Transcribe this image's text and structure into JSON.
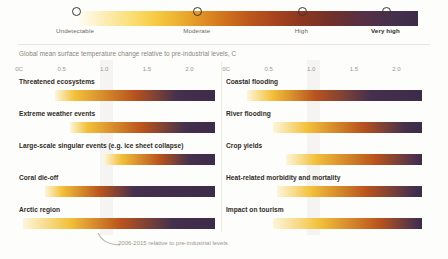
{
  "legend": {
    "title": "risk-legend",
    "stops": [
      {
        "label": "Undetectable",
        "pos": 0.0,
        "bold": false
      },
      {
        "label": "Moderate",
        "pos": 0.355,
        "bold": false
      },
      {
        "label": "High",
        "pos": 0.66,
        "bold": false
      },
      {
        "label": "Very high",
        "pos": 0.905,
        "bold": true
      }
    ],
    "gradient": [
      "#ffffff",
      "#fbdf78",
      "#e8a52c",
      "#bf5a1c",
      "#8d3720",
      "#593043",
      "#3d2b4a"
    ]
  },
  "caption": "Global mean surface temperature change relative to pre-industrial levels, C",
  "axis": {
    "ticks": [
      "0C",
      "0.5",
      "1.0",
      "1.5",
      "2.0"
    ],
    "tick_values": [
      0,
      0.5,
      1.0,
      1.5,
      2.0
    ],
    "min": 0,
    "max": 2.3
  },
  "annotation": {
    "text": "2006-2015 relative to pre-industrial levels"
  },
  "chart_data": {
    "type": "heatmap",
    "title": "Global mean surface temperature change relative to pre-industrial levels, C",
    "xlabel": "Global mean surface temperature change relative to pre-industrial levels, C",
    "ylabel": "",
    "xlim": [
      0,
      2.3
    ],
    "grid": false,
    "legend": "top",
    "legend_entries": [
      "Undetectable",
      "Moderate",
      "High",
      "Very high"
    ],
    "annotations": [
      "2006-2015 relative to pre-industrial levels"
    ],
    "columns": [
      {
        "name": "left-column",
        "rows": [
          {
            "label": "Threatened ecosystems",
            "start": 0.42,
            "end": 2.3,
            "transitions": [
              {
                "level": "undetectable",
                "at": 0.42
              },
              {
                "level": "moderate",
                "at": 0.65
              },
              {
                "level": "high",
                "at": 1.35
              },
              {
                "level": "very high",
                "at": 1.85
              }
            ]
          },
          {
            "label": "Extreme weather events",
            "start": 0.6,
            "end": 2.3,
            "transitions": [
              {
                "level": "undetectable",
                "at": 0.6
              },
              {
                "level": "moderate",
                "at": 0.8
              },
              {
                "level": "high",
                "at": 1.45
              },
              {
                "level": "very high",
                "at": 1.95
              }
            ]
          },
          {
            "label": "Large-scale singular events (e.g. ice sheet collapse)",
            "start": 1.0,
            "end": 2.3,
            "transitions": [
              {
                "level": "undetectable",
                "at": 1.0
              },
              {
                "level": "moderate",
                "at": 1.2
              },
              {
                "level": "high",
                "at": 1.65
              },
              {
                "level": "very high",
                "at": 2.0
              }
            ]
          },
          {
            "label": "Coral die-off",
            "start": 0.3,
            "end": 2.3,
            "transitions": [
              {
                "level": "undetectable",
                "at": 0.3
              },
              {
                "level": "moderate",
                "at": 0.5
              },
              {
                "level": "high",
                "at": 0.95
              },
              {
                "level": "very high",
                "at": 1.35
              }
            ]
          },
          {
            "label": "Arctic region",
            "start": 0.05,
            "end": 2.3,
            "transitions": [
              {
                "level": "undetectable",
                "at": 0.05
              },
              {
                "level": "moderate",
                "at": 0.6
              },
              {
                "level": "high",
                "at": 1.2
              },
              {
                "level": "very high",
                "at": 1.8
              }
            ]
          }
        ]
      },
      {
        "name": "right-column",
        "rows": [
          {
            "label": "Coastal flooding",
            "start": 0.25,
            "end": 2.3,
            "transitions": [
              {
                "level": "undetectable",
                "at": 0.25
              },
              {
                "level": "moderate",
                "at": 0.55
              },
              {
                "level": "high",
                "at": 1.05
              },
              {
                "level": "very high",
                "at": 1.7
              }
            ]
          },
          {
            "label": "River flooding",
            "start": 0.55,
            "end": 2.3,
            "transitions": [
              {
                "level": "undetectable",
                "at": 0.55
              },
              {
                "level": "moderate",
                "at": 0.95
              },
              {
                "level": "high",
                "at": 1.6
              },
              {
                "level": "very high",
                "at": 2.1
              }
            ]
          },
          {
            "label": "Crop yields",
            "start": 0.7,
            "end": 2.3,
            "transitions": [
              {
                "level": "undetectable",
                "at": 0.7
              },
              {
                "level": "moderate",
                "at": 1.05
              },
              {
                "level": "high",
                "at": 1.75
              },
              {
                "level": "very high",
                "at": 2.25
              }
            ]
          },
          {
            "label": "Heat-related morbidity and mortality",
            "start": 0.6,
            "end": 2.3,
            "transitions": [
              {
                "level": "undetectable",
                "at": 0.6
              },
              {
                "level": "moderate",
                "at": 1.0
              },
              {
                "level": "high",
                "at": 1.65
              },
              {
                "level": "very high",
                "at": 2.2
              }
            ]
          },
          {
            "label": "Impact on tourism",
            "start": 0.55,
            "end": 2.3,
            "transitions": [
              {
                "level": "undetectable",
                "at": 0.55
              },
              {
                "level": "moderate",
                "at": 1.1
              },
              {
                "level": "high",
                "at": 1.8
              },
              {
                "level": "very high",
                "at": 2.25
              }
            ]
          }
        ]
      }
    ]
  }
}
